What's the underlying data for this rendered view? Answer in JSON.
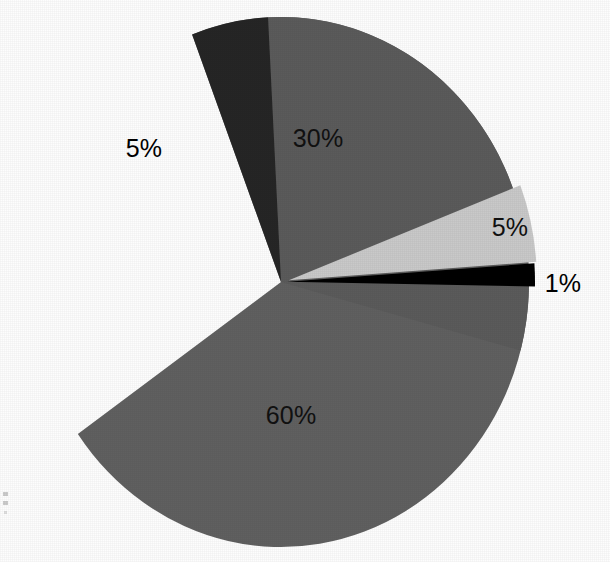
{
  "chart_data": {
    "type": "pie",
    "title": "",
    "xlabel": "",
    "ylabel": "",
    "legend": "none",
    "grid": false,
    "labels_shown_on_slices": true,
    "total_percent": 101,
    "center": {
      "x": 281,
      "y": 282
    },
    "radius": {
      "rx": 248,
      "ry": 265
    },
    "start_angle_deg": -2,
    "direction": "clockwise",
    "categories": [
      "30%",
      "5%",
      "60%",
      "1%",
      "5%"
    ],
    "values": [
      30,
      5,
      60,
      1,
      5
    ],
    "slices": [
      {
        "id": "slice-30",
        "label": "30%",
        "value": 30,
        "color": "#5b5b5b",
        "exploded": false,
        "start_angle_deg": -93,
        "end_angle_deg": 15,
        "label_x": 318,
        "label_y": 138,
        "label_color": "#111111"
      },
      {
        "id": "slice-5-dark",
        "label": "5%",
        "value": 5,
        "color": "#262626",
        "exploded": false,
        "start_angle_deg": -111,
        "end_angle_deg": -93,
        "label_x": 144,
        "label_y": 148,
        "label_color": "#000000"
      },
      {
        "id": "slice-60",
        "label": "60%",
        "value": 60,
        "color": "#606060",
        "exploded": false,
        "start_angle_deg": -111,
        "end_angle_deg": 145,
        "label_x": 291,
        "label_y": 415,
        "label_color": "#111111"
      },
      {
        "id": "slice-1-black",
        "label": "1%",
        "value": 1,
        "color": "#000000",
        "exploded": true,
        "explode_offset_px": 6,
        "start_angle_deg": -4,
        "end_angle_deg": 1,
        "label_x": 563,
        "label_y": 283,
        "label_color": "#000000"
      },
      {
        "id": "slice-5-light",
        "label": "5%",
        "value": 5,
        "color": "#c9c9c9",
        "exploded": true,
        "explode_offset_px": 8,
        "start_angle_deg": -21,
        "end_angle_deg": -4,
        "label_x": 510,
        "label_y": 227,
        "label_color": "#111111"
      }
    ],
    "colors": {
      "dark_gray": "#5b5b5b",
      "near_black": "#262626",
      "mid_gray": "#606060",
      "black": "#000000",
      "light_gray": "#c9c9c9",
      "background": "#fdfdfd",
      "label_text": "#111111"
    }
  },
  "labels": {
    "pct_30": "30%",
    "pct_5_dark": "5%",
    "pct_60": "60%",
    "pct_1": "1%",
    "pct_5_light": "5%"
  }
}
